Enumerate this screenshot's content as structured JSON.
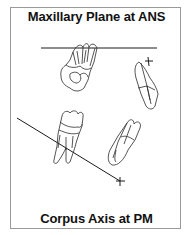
{
  "diagram": {
    "top_label": "Maxillary Plane at ANS",
    "bottom_label": "Corpus Axis at PM",
    "elements": [
      {
        "type": "reference-line",
        "name": "maxillary-plane-line",
        "orientation": "horizontal"
      },
      {
        "type": "reference-line",
        "name": "corpus-axis-line",
        "orientation": "diagonal"
      },
      {
        "type": "crosshair",
        "name": "ans-marker"
      },
      {
        "type": "crosshair",
        "name": "pm-marker"
      },
      {
        "type": "tooth",
        "name": "upper-molar"
      },
      {
        "type": "tooth",
        "name": "upper-incisor"
      },
      {
        "type": "tooth",
        "name": "lower-molar"
      },
      {
        "type": "tooth",
        "name": "lower-incisor"
      }
    ],
    "colors": {
      "line": "#1a1a1a",
      "border": "#9a9a9a",
      "background": "#ffffff"
    }
  }
}
